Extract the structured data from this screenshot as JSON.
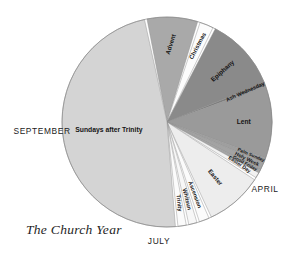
{
  "figure": {
    "caption": "The Church Year",
    "background": "#ffffff"
  },
  "chart_data": {
    "type": "pie",
    "title": "The Church Year",
    "center": [
      167,
      122
    ],
    "radius": 105,
    "legend": "none",
    "grid": false,
    "note": "Liturgical year divided into seasons; slice sizes approximate calendar duration. Angles measured clockwise from 12 o'clock.",
    "categories": [
      "Advent",
      "Christmas",
      "Epiphany",
      "Ash Wednesday",
      "Lent",
      "Palm Sunday",
      "Holy Week",
      "Good Friday",
      "Easter Day",
      "Easter",
      "Ascension",
      "Whitsun",
      "Trinity",
      "Sundays after Trinity"
    ],
    "values": [
      8,
      2,
      16,
      0.6,
      16,
      1.2,
      1.6,
      0.8,
      1.2,
      13,
      2.4,
      2.2,
      2.4,
      112
    ],
    "colors": [
      "#a9a9a9",
      "#fcfcfc",
      "#8a8a8a",
      "#7e7e7e",
      "#9a9a9a",
      "#9f9f9f",
      "#a3a3a3",
      "#a6a6a6",
      "#f2f2f2",
      "#ededed",
      "#fbfbfb",
      "#f7f7f7",
      "#fbfbfb",
      "#d4d4d4"
    ],
    "slices": [
      {
        "label": "Advent",
        "start_deg": 349.0,
        "end_deg": 17.0,
        "color": "#a9a9a9",
        "label_rot": -72,
        "label_r": 0.74,
        "font": 6.2
      },
      {
        "label": "Christmas",
        "start_deg": 18.4,
        "end_deg": 26.0,
        "color": "#fcfcfc",
        "label_rot": -62,
        "label_r": 0.78,
        "font": 6.0
      },
      {
        "label": "Epiphany",
        "start_deg": 27.4,
        "end_deg": 68.0,
        "color": "#8a8a8a",
        "label_rot": -42,
        "label_r": 0.72,
        "font": 6.4
      },
      {
        "label": "Ash Wednesday",
        "start_deg": 68.0,
        "end_deg": 70.0,
        "color": "#7e7e7e",
        "label_rot": -24,
        "label_r": 0.8,
        "font": 5.4
      },
      {
        "label": "Lent",
        "start_deg": 70.0,
        "end_deg": 110.0,
        "color": "#9a9a9a",
        "label_rot": 0,
        "label_r": 0.73,
        "font": 6.6
      },
      {
        "label": "Palm Sunday",
        "start_deg": 110.0,
        "end_deg": 113.0,
        "color": "#9f9f9f",
        "label_rot": 23,
        "label_r": 0.86,
        "font": 4.6
      },
      {
        "label": "Holy Week",
        "start_deg": 113.0,
        "end_deg": 117.0,
        "color": "#a3a3a3",
        "label_rot": 26,
        "label_r": 0.84,
        "font": 5.2
      },
      {
        "label": "Good Friday",
        "start_deg": 117.0,
        "end_deg": 119.0,
        "color": "#a6a6a6",
        "label_rot": 29,
        "label_r": 0.84,
        "font": 4.6
      },
      {
        "label": "Easter Day",
        "start_deg": 119.0,
        "end_deg": 122.0,
        "color": "#f2f2f2",
        "label_rot": 34,
        "label_r": 0.8,
        "font": 5.0
      },
      {
        "label": "Easter",
        "start_deg": 123.4,
        "end_deg": 155.0,
        "color": "#ededed",
        "label_rot": 50,
        "label_r": 0.7,
        "font": 6.2
      },
      {
        "label": "Ascension",
        "start_deg": 156.4,
        "end_deg": 162.0,
        "color": "#fbfbfb",
        "label_rot": 70,
        "label_r": 0.74,
        "font": 5.6
      },
      {
        "label": "Whitsun",
        "start_deg": 163.4,
        "end_deg": 168.0,
        "color": "#f7f7f7",
        "label_rot": 76,
        "label_r": 0.76,
        "font": 5.6
      },
      {
        "label": "Trinity",
        "start_deg": 169.4,
        "end_deg": 174.0,
        "color": "#fbfbfb",
        "label_rot": 84,
        "label_r": 0.78,
        "font": 5.6
      },
      {
        "label": "Sundays after Trinity",
        "start_deg": 175.4,
        "end_deg": 347.6,
        "color": "#d4d4d4",
        "label_rot": 0,
        "label_r": 0.56,
        "font": 6.8
      }
    ],
    "month_markers": [
      {
        "label": "SEPTEMBER",
        "x": 42,
        "y": 134,
        "anchor": "middle",
        "font": 8.4
      },
      {
        "label": "JULY",
        "x": 159,
        "y": 244,
        "anchor": "middle",
        "font": 8.4
      },
      {
        "label": "APRIL",
        "x": 265,
        "y": 192,
        "anchor": "middle",
        "font": 8.4
      }
    ]
  }
}
